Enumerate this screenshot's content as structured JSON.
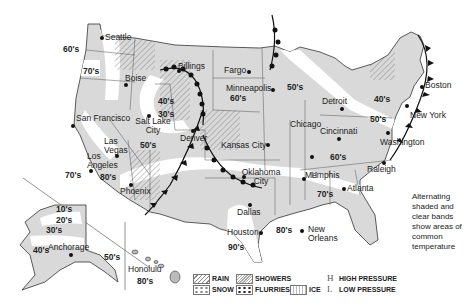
{
  "map": {
    "title": "US weather map",
    "colors": {
      "shaded_band": "#d9d9d9",
      "clear_band": "#ffffff",
      "border": "#333333",
      "front": "#111111"
    },
    "cities": [
      {
        "name": "Seattle",
        "x": 100,
        "y": 37
      },
      {
        "name": "Boise",
        "x": 125,
        "y": 79
      },
      {
        "name": "Billings",
        "x": 178,
        "y": 66
      },
      {
        "name": "Fargo",
        "x": 248,
        "y": 71
      },
      {
        "name": "Minneapolis",
        "x": 272,
        "y": 89
      },
      {
        "name": "San Francisco",
        "x": 72,
        "y": 124
      },
      {
        "name": "Salt Lake City",
        "x": 148,
        "y": 117
      },
      {
        "name": "Las Vegas",
        "x": 116,
        "y": 154
      },
      {
        "name": "Denver",
        "x": 192,
        "y": 131
      },
      {
        "name": "Chicago",
        "x": 311,
        "y": 156
      },
      {
        "name": "Detroit",
        "x": 341,
        "y": 107
      },
      {
        "name": "Cincinnati",
        "x": 338,
        "y": 137
      },
      {
        "name": "Kansas City",
        "x": 267,
        "y": 144
      },
      {
        "name": "Los Angeles",
        "x": 90,
        "y": 169
      },
      {
        "name": "Phoenix",
        "x": 131,
        "y": 183
      },
      {
        "name": "Oklahoma City",
        "x": 243,
        "y": 176
      },
      {
        "name": "Memphis",
        "x": 303,
        "y": 178
      },
      {
        "name": "Atlanta",
        "x": 343,
        "y": 187
      },
      {
        "name": "Dallas",
        "x": 249,
        "y": 253
      },
      {
        "name": "Houston",
        "x": 259,
        "y": 231
      },
      {
        "name": "New Orleans",
        "x": 302,
        "y": 229
      },
      {
        "name": "Raleigh",
        "x": 383,
        "y": 161
      },
      {
        "name": "Washington",
        "x": 387,
        "y": 130
      },
      {
        "name": "New York",
        "x": 406,
        "y": 105
      },
      {
        "name": "Boston",
        "x": 421,
        "y": 86
      },
      {
        "name": "Anchorage",
        "x": 69,
        "y": 253
      },
      {
        "name": "Honolulu",
        "x": 148,
        "y": 272
      }
    ],
    "temperatures": [
      {
        "label": "60's",
        "x": 63,
        "y": 45
      },
      {
        "label": "70's",
        "x": 83,
        "y": 67
      },
      {
        "label": "40's",
        "x": 158,
        "y": 97
      },
      {
        "label": "30's",
        "x": 158,
        "y": 110
      },
      {
        "label": "50's",
        "x": 140,
        "y": 141
      },
      {
        "label": "60's",
        "x": 230,
        "y": 94
      },
      {
        "label": "50's",
        "x": 287,
        "y": 83
      },
      {
        "label": "40's",
        "x": 374,
        "y": 95
      },
      {
        "label": "50's",
        "x": 370,
        "y": 115
      },
      {
        "label": "60's",
        "x": 330,
        "y": 153
      },
      {
        "label": "70's",
        "x": 65,
        "y": 171
      },
      {
        "label": "80's",
        "x": 100,
        "y": 173
      },
      {
        "label": "70's",
        "x": 317,
        "y": 190
      },
      {
        "label": "80's",
        "x": 276,
        "y": 226
      },
      {
        "label": "90's",
        "x": 228,
        "y": 243
      },
      {
        "label": "10's",
        "x": 56,
        "y": 205
      },
      {
        "label": "20's",
        "x": 56,
        "y": 216
      },
      {
        "label": "30's",
        "x": 46,
        "y": 226
      },
      {
        "label": "40's",
        "x": 33,
        "y": 246
      },
      {
        "label": "50's",
        "x": 104,
        "y": 253
      },
      {
        "label": "80's",
        "x": 137,
        "y": 277
      }
    ],
    "pressure_markers": [
      {
        "symbol": "H",
        "x": 311,
        "y": 170
      }
    ]
  },
  "legend": {
    "items": [
      {
        "key": "rain",
        "label": "RAIN"
      },
      {
        "key": "showers",
        "label": "SHOWERS"
      },
      {
        "key": "snow",
        "label": "SNOW"
      },
      {
        "key": "flurries",
        "label": "FLURRIES"
      },
      {
        "key": "ice",
        "label": "ICE"
      }
    ],
    "pressure": [
      {
        "symbol": "H",
        "label": "HIGH PRESSURE"
      },
      {
        "symbol": "L",
        "label": "LOW PRESSURE"
      }
    ]
  },
  "note": "Alternating shaded and clear bands show areas of common temperature"
}
